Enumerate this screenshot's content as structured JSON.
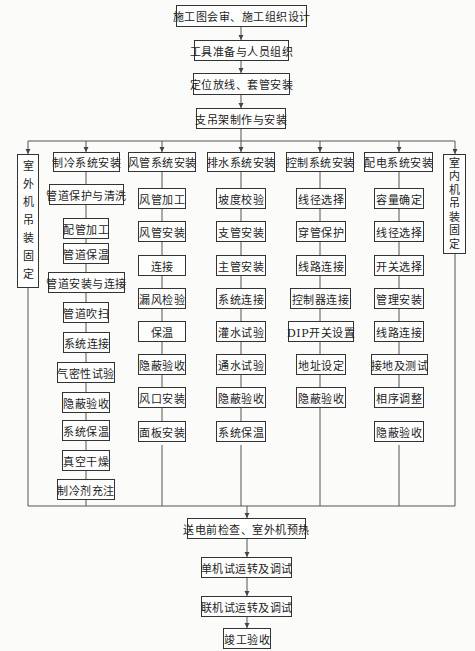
{
  "top_sequence": [
    "施工图会审、施工组织设计",
    "工具准备与人员组织",
    "定位放线、套管安装",
    "支吊架制作与安装"
  ],
  "side_left": {
    "label": "室外机吊装固定",
    "chars": [
      "室",
      "外",
      "机",
      "吊",
      "装",
      "固",
      "定"
    ]
  },
  "side_right": {
    "label": "室内机吊装固定",
    "chars": [
      "室",
      "内",
      "机",
      "吊",
      "装",
      "固",
      "定"
    ]
  },
  "columns": [
    {
      "header": "制冷系统安装",
      "steps": [
        "管道保护与清洗",
        "配管加工",
        "管道保温",
        "管道安装与连接",
        "管道吹扫",
        "系统连接",
        "气密性试验",
        "隐蔽验收",
        "系统保温",
        "真空干燥",
        "制冷剂充注"
      ]
    },
    {
      "header": "风管系统安装",
      "steps": [
        "风管加工",
        "风管安装",
        "连接",
        "漏风检验",
        "保温",
        "隐蔽验收",
        "风口安装",
        "面板安装"
      ]
    },
    {
      "header": "排水系统安装",
      "steps": [
        "坡度校验",
        "支管安装",
        "主管安装",
        "系统连接",
        "灌水试验",
        "通水试验",
        "隐蔽验收",
        "系统保温"
      ]
    },
    {
      "header": "控制系统安装",
      "steps": [
        "线径选择",
        "穿管保护",
        "线路连接",
        "控制器连接",
        "DIP开关设置",
        "地址设定",
        "隐蔽验收"
      ]
    },
    {
      "header": "配电系统安装",
      "steps": [
        "容量确定",
        "线径选择",
        "开关选择",
        "管理安装",
        "线路连接",
        "接地及测试",
        "相序调整",
        "隐蔽验收"
      ]
    }
  ],
  "bottom_sequence": [
    "送电前检查、室外机预热",
    "单机试运转及调试",
    "联机试运转及调试",
    "竣工验收"
  ],
  "colors": {
    "line": "#555555",
    "border": "#333333",
    "background": "#fbfbf9"
  }
}
